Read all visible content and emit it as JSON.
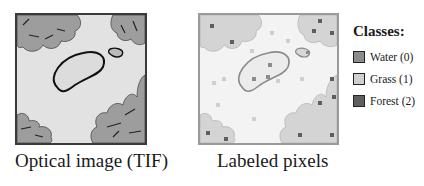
{
  "panels": {
    "optical": {
      "caption": "Optical image (TIF)"
    },
    "labeled": {
      "caption": "Labeled pixels"
    }
  },
  "legend": {
    "title": "Classes:",
    "items": [
      {
        "label": "Water (0)",
        "color": "#8c8c8c"
      },
      {
        "label": "Grass (1)",
        "color": "#cfcfcf"
      },
      {
        "label": "Forest (2)",
        "color": "#5e5e5e"
      }
    ]
  },
  "colors": {
    "water": "#8c8c8c",
    "grass": "#cfcfcf",
    "forest": "#5e5e5e",
    "tree_fill": "#9d9d9d",
    "labeled_tree_fill": "#d4d4d4",
    "ground": "#e2e2e2"
  }
}
